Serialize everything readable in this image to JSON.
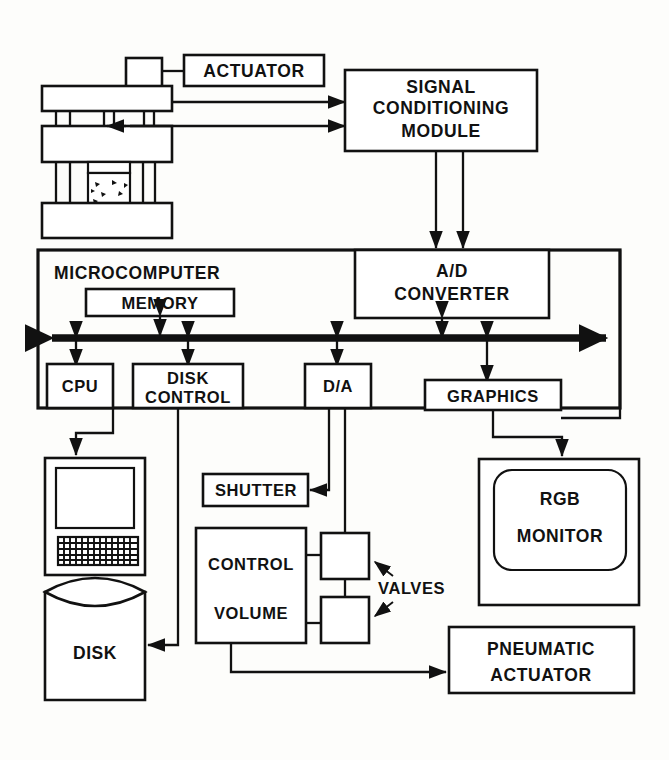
{
  "diagram": {
    "blocks": {
      "actuator": "ACTUATOR",
      "signal_conditioning_l1": "SIGNAL",
      "signal_conditioning_l2": "CONDITIONING",
      "signal_conditioning_l3": "MODULE",
      "microcomputer": "MICROCOMPUTER",
      "memory": "MEMORY",
      "ad_converter_l1": "A/D",
      "ad_converter_l2": "CONVERTER",
      "cpu": "CPU",
      "disk_control_l1": "DISK",
      "disk_control_l2": "CONTROL",
      "da": "D/A",
      "graphics": "GRAPHICS",
      "shutter": "SHUTTER",
      "control_volume_l1": "CONTROL",
      "control_volume_l2": "VOLUME",
      "valves": "VALVES",
      "disk": "DISK",
      "rgb_monitor_l1": "RGB",
      "rgb_monitor_l2": "MONITOR",
      "pneumatic_actuator_l1": "PNEUMATIC",
      "pneumatic_actuator_l2": "ACTUATOR"
    },
    "colors": {
      "ink": "#111111",
      "paper": "#fdfdfb"
    }
  }
}
